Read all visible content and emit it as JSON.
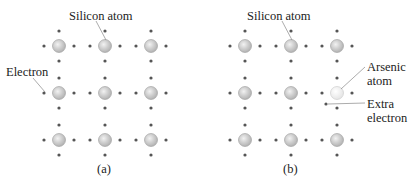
{
  "panels": [
    {
      "id": "a",
      "caption": "(a)",
      "labels": {
        "silicon": "Silicon atom",
        "electron": "Electron"
      },
      "atom_x": [
        59,
        105,
        151
      ],
      "atom_y": [
        46,
        93,
        140
      ],
      "special_atom": null
    },
    {
      "id": "b",
      "caption": "(b)",
      "labels": {
        "silicon": "Silicon atom",
        "arsenic_line1": "Arsenic",
        "arsenic_line2": "atom",
        "extra_line1": "Extra",
        "extra_line2": "electron"
      },
      "atom_x": [
        245,
        291,
        337
      ],
      "atom_y": [
        46,
        93,
        140
      ],
      "special_atom": {
        "row": 1,
        "col": 2,
        "type": "arsenic"
      },
      "extra_electron": {
        "x": 326,
        "y": 104
      }
    }
  ],
  "colors": {
    "atom_fill": "#b5b5b5",
    "atom_highlight": "#f2f2f2",
    "arsenic_fill": "#e6e6e6",
    "electron": "#555555",
    "text": "#222222",
    "leader": "#888888"
  }
}
